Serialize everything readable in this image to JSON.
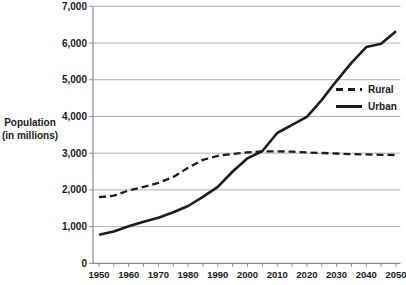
{
  "figure": {
    "background": "#ffffff",
    "width": 406,
    "height": 285
  },
  "colors": {
    "series": "#1c1c1c",
    "grid": "#b0b0b0",
    "axis": "#8c8c8c",
    "text": "#1a1a1a"
  },
  "y_axis": {
    "title_line1": "Population",
    "title_line2": "(in millions)",
    "tick_labels": [
      "0",
      "1,000",
      "2,000",
      "3,000",
      "4,000",
      "5,000",
      "6,000",
      "7,000"
    ],
    "tick_values": [
      0,
      1000,
      2000,
      3000,
      4000,
      5000,
      6000,
      7000
    ]
  },
  "x_axis": {
    "tick_labels": [
      "1950",
      "1960",
      "1970",
      "1980",
      "1990",
      "2000",
      "2010",
      "2020",
      "2030",
      "2040",
      "2050"
    ],
    "tick_values": [
      1950,
      1960,
      1970,
      1980,
      1990,
      2000,
      2010,
      2020,
      2030,
      2040,
      2050
    ],
    "minor_tick_step": 5
  },
  "legend": {
    "items": [
      {
        "label": "Rural",
        "line_style": "dashed"
      },
      {
        "label": "Urban",
        "line_style": "solid"
      }
    ]
  },
  "chart_data": {
    "type": "line",
    "title": "",
    "xlabel": "",
    "ylabel": "Population (in millions)",
    "xlim": [
      1950,
      2050
    ],
    "ylim": [
      0,
      7000
    ],
    "grid": "horizontal",
    "legend_position": "right-middle",
    "x": [
      1950,
      1955,
      1960,
      1965,
      1970,
      1975,
      1980,
      1985,
      1990,
      1995,
      2000,
      2005,
      2010,
      2015,
      2020,
      2025,
      2030,
      2035,
      2040,
      2045,
      2050
    ],
    "series": [
      {
        "name": "Rural",
        "style": "dashed",
        "values": [
          1800,
          1840,
          1985,
          2080,
          2190,
          2350,
          2600,
          2815,
          2925,
          2980,
          3020,
          3050,
          3050,
          3040,
          3020,
          3005,
          2990,
          2975,
          2965,
          2955,
          2950
        ]
      },
      {
        "name": "Urban",
        "style": "solid",
        "values": [
          780,
          870,
          1010,
          1130,
          1240,
          1390,
          1560,
          1810,
          2080,
          2500,
          2860,
          3060,
          3550,
          3770,
          3990,
          4450,
          4970,
          5460,
          5890,
          5980,
          6320
        ]
      }
    ]
  }
}
